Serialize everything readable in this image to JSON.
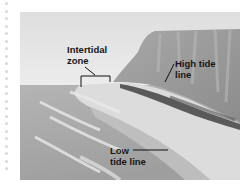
{
  "figure": {
    "labels": {
      "intertidal_line1": "Intertidal",
      "intertidal_line2": "zone",
      "high_tide_line1": "High tide",
      "high_tide_line2": "line",
      "low_tide_line1": "Low",
      "low_tide_line2": "tide line"
    },
    "colors": {
      "sky": "#e6e6e6",
      "sea": "#a9a9a9",
      "beach": "#dedede",
      "cliff": "#9c9c9c",
      "vegetation": "#3a3a3a",
      "label_text": "#161616"
    }
  }
}
